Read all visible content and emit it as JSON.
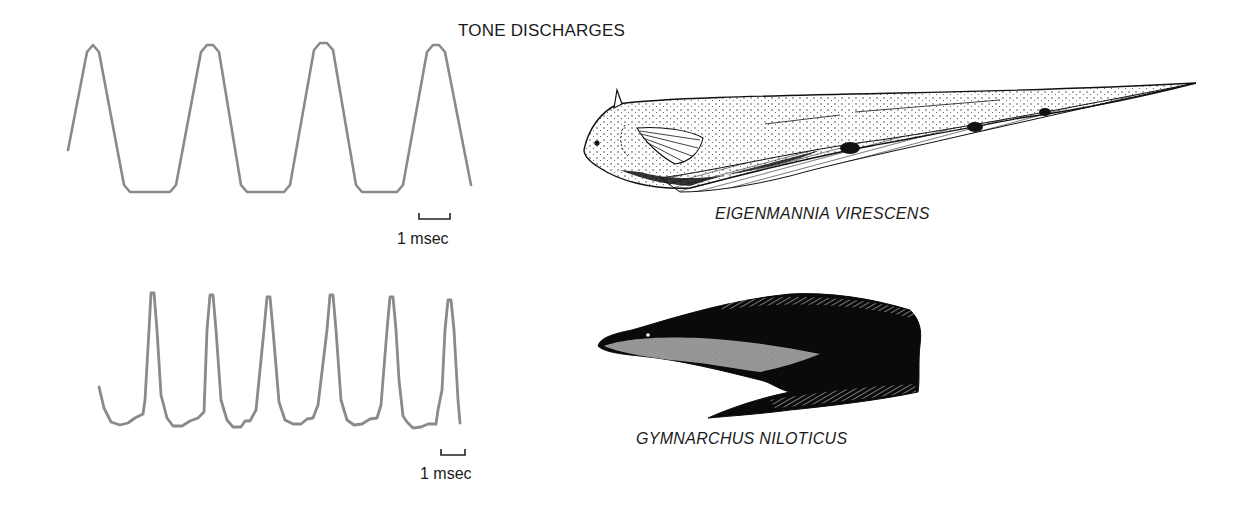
{
  "title": "TONE DISCHARGES",
  "chart_data": {
    "type": "line",
    "title": "TONE DISCHARGES",
    "grid": false,
    "series": [
      {
        "name": "Eigenmannia virescens discharge",
        "waveform": "trapezoidal / quasi-sinusoidal",
        "cycles_visible": 4,
        "scale_bar": "1 msec",
        "color": "#8a8a8a",
        "points": [
          [
            68,
            150
          ],
          [
            87,
            52
          ],
          [
            93,
            45
          ],
          [
            99,
            52
          ],
          [
            124,
            185
          ],
          [
            130,
            192
          ],
          [
            170,
            192
          ],
          [
            176,
            185
          ],
          [
            201,
            52
          ],
          [
            207,
            45
          ],
          [
            213,
            45
          ],
          [
            219,
            52
          ],
          [
            241,
            185
          ],
          [
            247,
            192
          ],
          [
            284,
            192
          ],
          [
            290,
            185
          ],
          [
            314,
            50
          ],
          [
            320,
            43
          ],
          [
            327,
            43
          ],
          [
            333,
            50
          ],
          [
            356,
            185
          ],
          [
            362,
            192
          ],
          [
            397,
            192
          ],
          [
            403,
            185
          ],
          [
            427,
            52
          ],
          [
            433,
            45
          ],
          [
            439,
            45
          ],
          [
            445,
            52
          ],
          [
            471,
            185
          ]
        ]
      },
      {
        "name": "Gymnarchus niloticus discharge",
        "waveform": "pulse-like peaks",
        "cycles_visible": 6,
        "scale_bar": "1 msec",
        "color": "#8a8a8a",
        "points": [
          [
            99,
            387
          ],
          [
            104,
            408
          ],
          [
            111,
            422
          ],
          [
            120,
            425
          ],
          [
            128,
            423
          ],
          [
            135,
            418
          ],
          [
            143,
            414
          ],
          [
            145,
            400
          ],
          [
            149,
            330
          ],
          [
            151,
            293
          ],
          [
            154,
            293
          ],
          [
            157,
            330
          ],
          [
            161,
            395
          ],
          [
            167,
            418
          ],
          [
            173,
            426
          ],
          [
            182,
            426
          ],
          [
            190,
            421
          ],
          [
            198,
            418
          ],
          [
            204,
            412
          ],
          [
            207,
            330
          ],
          [
            210,
            295
          ],
          [
            213,
            295
          ],
          [
            216,
            330
          ],
          [
            221,
            400
          ],
          [
            227,
            420
          ],
          [
            233,
            427
          ],
          [
            241,
            427
          ],
          [
            245,
            421
          ],
          [
            250,
            421
          ],
          [
            256,
            410
          ],
          [
            264,
            330
          ],
          [
            267,
            297
          ],
          [
            270,
            297
          ],
          [
            273,
            330
          ],
          [
            279,
            402
          ],
          [
            285,
            420
          ],
          [
            293,
            424
          ],
          [
            301,
            424
          ],
          [
            307,
            419
          ],
          [
            313,
            418
          ],
          [
            318,
            405
          ],
          [
            327,
            330
          ],
          [
            330,
            295
          ],
          [
            333,
            295
          ],
          [
            336,
            330
          ],
          [
            341,
            400
          ],
          [
            347,
            420
          ],
          [
            354,
            425
          ],
          [
            362,
            424
          ],
          [
            370,
            419
          ],
          [
            377,
            418
          ],
          [
            381,
            405
          ],
          [
            387,
            330
          ],
          [
            390,
            297
          ],
          [
            393,
            297
          ],
          [
            396,
            330
          ],
          [
            399,
            380
          ],
          [
            403,
            416
          ],
          [
            407,
            422
          ],
          [
            413,
            428
          ],
          [
            421,
            427
          ],
          [
            428,
            424
          ],
          [
            436,
            424
          ],
          [
            438,
            410
          ],
          [
            442,
            390
          ],
          [
            445,
            330
          ],
          [
            448,
            300
          ],
          [
            451,
            300
          ],
          [
            454,
            330
          ],
          [
            458,
            400
          ],
          [
            460,
            423
          ]
        ]
      }
    ],
    "annotations": [
      "1 msec",
      "1 msec",
      "EIGENMANNIA VIRESCENS",
      "GYMNARCHUS NILOTICUS"
    ]
  },
  "panels": [
    {
      "species": "EIGENMANNIA VIRESCENS",
      "scale_bar_label": "1 msec"
    },
    {
      "species": "GYMNARCHUS NILOTICUS",
      "scale_bar_label": "1 msec"
    }
  ]
}
